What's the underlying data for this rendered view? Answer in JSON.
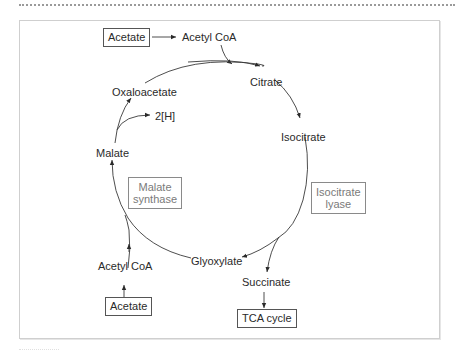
{
  "diagram": {
    "type": "metabolic-cycle",
    "inputs": [
      {
        "id": "acetate_top",
        "label": "Acetate",
        "boxed": true
      },
      {
        "id": "acetate_bottom",
        "label": "Acetate",
        "boxed": true
      }
    ],
    "metabolites": {
      "acetyl_coa_top": "Acetyl CoA",
      "citrate": "Citrate",
      "isocitrate": "Isocitrate",
      "succinate": "Succinate",
      "glyoxylate": "Glyoxylate",
      "acetyl_coa_bottom": "Acetyl CoA",
      "malate": "Malate",
      "oxaloacetate": "Oxaloacetate",
      "reducing_equivalents": "2[H]"
    },
    "enzymes": {
      "malate_synthase": [
        "Malate",
        "synthase"
      ],
      "isocitrate_lyase": [
        "Isocitrate",
        "lyase"
      ]
    },
    "outputs": {
      "tca_cycle": "TCA cycle"
    },
    "edges": [
      [
        "Acetate",
        "Acetyl CoA"
      ],
      [
        "Acetyl CoA",
        "Citrate"
      ],
      [
        "Oxaloacetate",
        "Citrate"
      ],
      [
        "Citrate",
        "Isocitrate"
      ],
      [
        "Isocitrate",
        "Glyoxylate"
      ],
      [
        "Isocitrate",
        "Succinate"
      ],
      [
        "Succinate",
        "TCA cycle"
      ],
      [
        "Glyoxylate",
        "Malate"
      ],
      [
        "Acetate",
        "Acetyl CoA"
      ],
      [
        "Acetyl CoA",
        "Malate"
      ],
      [
        "Malate",
        "Oxaloacetate"
      ],
      [
        "Malate",
        "2[H]"
      ]
    ],
    "colors": {
      "line": "#3a3a3a",
      "enzyme_text": "#7a7a7a",
      "frame": "#cfcfcf"
    }
  }
}
